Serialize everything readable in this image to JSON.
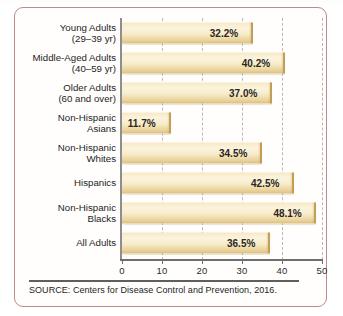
{
  "figure": {
    "border_color": "#c08a86",
    "background": "#fffefc",
    "source_note": "SOURCE: Centers for Disease Control and Prevention, 2016."
  },
  "chart_data": {
    "type": "bar",
    "orientation": "horizontal",
    "title": "",
    "xlabel": "",
    "ylabel": "",
    "xlim": [
      0,
      50
    ],
    "xticks": [
      0,
      10,
      20,
      30,
      40,
      50
    ],
    "xtick_labels": [
      "0",
      "10",
      "20",
      "30",
      "40",
      "50"
    ],
    "grid": "vertical-dashed",
    "legend": "none",
    "value_suffix": "%",
    "bar_color": "#f4e6bd",
    "bar_edge_color": "#c9a559",
    "categories": [
      "Young Adults (29–39 yr)",
      "Middle-Aged Adults (40–59 yr)",
      "Older Adults (60 and over)",
      "Non-Hispanic Asians",
      "Non-Hispanic Whites",
      "Hispanics",
      "Non-Hispanic Blacks",
      "All Adults"
    ],
    "values": [
      32.2,
      40.2,
      37.0,
      11.7,
      34.5,
      42.5,
      48.1,
      36.5
    ],
    "data_labels": [
      "32.2%",
      "40.2%",
      "37.0%",
      "11.7%",
      "34.5%",
      "42.5%",
      "48.1%",
      "36.5%"
    ]
  },
  "rows": [
    {
      "line1": "Young Adults",
      "line2": "(29–39 yr)",
      "value": 32.2,
      "label": "32.2%"
    },
    {
      "line1": "Middle-Aged Adults",
      "line2": "(40–59 yr)",
      "value": 40.2,
      "label": "40.2%"
    },
    {
      "line1": "Older Adults",
      "line2": "(60 and over)",
      "value": 37.0,
      "label": "37.0%"
    },
    {
      "line1": "Non-Hispanic",
      "line2": "Asians",
      "value": 11.7,
      "label": "11.7%"
    },
    {
      "line1": "Non-Hispanic",
      "line2": "Whites",
      "value": 34.5,
      "label": "34.5%"
    },
    {
      "line1": "Hispanics",
      "line2": "",
      "value": 42.5,
      "label": "42.5%"
    },
    {
      "line1": "Non-Hispanic",
      "line2": "Blacks",
      "value": 48.1,
      "label": "48.1%"
    },
    {
      "line1": "All Adults",
      "line2": "",
      "value": 36.5,
      "label": "36.5%"
    }
  ],
  "axis": {
    "ticks": [
      "0",
      "10",
      "20",
      "30",
      "40",
      "50"
    ]
  }
}
